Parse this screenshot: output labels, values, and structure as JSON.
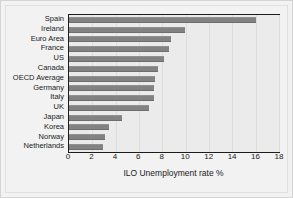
{
  "chart_data": {
    "type": "bar",
    "orientation": "horizontal",
    "title": "",
    "subtitle": "",
    "xlabel": "ILO Unemployment rate %",
    "ylabel": "",
    "xlim": [
      0,
      18
    ],
    "xticks": [
      0,
      2,
      4,
      6,
      8,
      10,
      12,
      14,
      16,
      18
    ],
    "xtick_labels": [
      "0",
      "2",
      "4",
      "6",
      "8",
      "10",
      "12",
      "14",
      "16",
      "18"
    ],
    "grid": "vertical",
    "legend": null,
    "categories": [
      "Spain",
      "Ireland",
      "Euro Area",
      "France",
      "US",
      "Canada",
      "OECD Average",
      "Germany",
      "Italy",
      "UK",
      "Japan",
      "Korea",
      "Norway",
      "Netherlands"
    ],
    "values": [
      16.0,
      9.9,
      8.7,
      8.6,
      8.1,
      7.6,
      7.4,
      7.3,
      7.3,
      6.9,
      4.5,
      3.4,
      3.1,
      2.9
    ],
    "bar_color": "#828282",
    "plot_background": "#ebebeb",
    "figure_background": "#f2f2f2",
    "axis_color": "#1c1c1c"
  }
}
